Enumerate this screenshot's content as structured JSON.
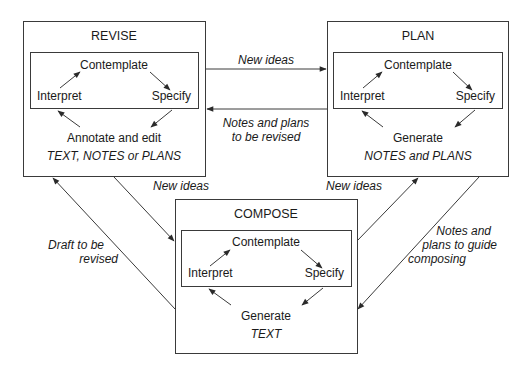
{
  "nodes": {
    "revise": {
      "title": "REVISE",
      "cycle": {
        "top": "Contemplate",
        "left": "Interpret",
        "right": "Specify"
      },
      "action": "Annotate and edit",
      "output": "TEXT, NOTES or PLANS"
    },
    "plan": {
      "title": "PLAN",
      "cycle": {
        "top": "Contemplate",
        "left": "Interpret",
        "right": "Specify"
      },
      "action": "Generate",
      "output": "NOTES and PLANS"
    },
    "compose": {
      "title": "COMPOSE",
      "cycle": {
        "top": "Contemplate",
        "left": "Interpret",
        "right": "Specify"
      },
      "action": "Generate",
      "output": "TEXT"
    }
  },
  "edges": {
    "revise_to_plan": "New ideas",
    "plan_to_revise": [
      "Notes and plans",
      "to be revised"
    ],
    "revise_to_compose": "New ideas",
    "compose_to_revise": [
      "Draft to be",
      "revised"
    ],
    "compose_to_plan": "New ideas",
    "plan_to_compose": [
      "Notes and",
      "plans to guide",
      "composing"
    ]
  },
  "colors": {
    "line": "#3a3a3a",
    "text": "#1a1a1a",
    "background": "#ffffff"
  }
}
